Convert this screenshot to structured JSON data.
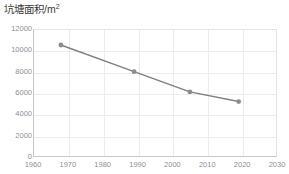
{
  "chart_data": {
    "type": "line",
    "title_main": "坑塘面积/m",
    "title_sup": "2",
    "xlabel": "",
    "ylabel": "",
    "xlim": [
      1960,
      2030
    ],
    "ylim": [
      0,
      12000
    ],
    "grid": true,
    "legend": false,
    "x_ticks": [
      1960,
      1970,
      1980,
      1990,
      2000,
      2010,
      2020,
      2030
    ],
    "y_ticks": [
      0,
      2000,
      4000,
      6000,
      8000,
      10000,
      12000
    ],
    "x": [
      1968,
      1989,
      2005,
      2019
    ],
    "values": [
      10500,
      8000,
      6100,
      5200
    ],
    "series": [
      {
        "name": "坑塘面积",
        "x": [
          1968,
          1989,
          2005,
          2019
        ],
        "values": [
          10500,
          8000,
          6100,
          5200
        ]
      }
    ],
    "marker": "circle",
    "line_color": "#7f7f7f",
    "marker_color": "#8c8c8c",
    "grid_color": "#ececec",
    "axis_color": "#c8c8c8",
    "tick_label_color": "#8f8f8f",
    "title_color": "#3b3b3b",
    "background": "#ffffff"
  }
}
